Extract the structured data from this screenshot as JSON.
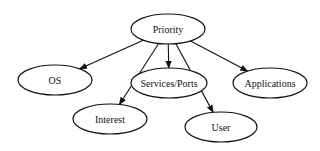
{
  "diagram": {
    "type": "tree",
    "root": "Priority",
    "nodes": [
      {
        "id": "priority",
        "label": "Priority",
        "cx": 168,
        "cy": 29,
        "rx": 37,
        "ry": 15
      },
      {
        "id": "os",
        "label": "OS",
        "cx": 55,
        "cy": 80,
        "rx": 37,
        "ry": 15
      },
      {
        "id": "services",
        "label": "Services/Ports",
        "cx": 169,
        "cy": 83,
        "rx": 38,
        "ry": 15
      },
      {
        "id": "applications",
        "label": "Applications",
        "cx": 270,
        "cy": 83,
        "rx": 37,
        "ry": 15
      },
      {
        "id": "interest",
        "label": "Interest",
        "cx": 110,
        "cy": 119,
        "rx": 37,
        "ry": 15
      },
      {
        "id": "user",
        "label": "User",
        "cx": 221,
        "cy": 127,
        "rx": 36,
        "ry": 15
      }
    ],
    "edges": [
      {
        "from": "Priority",
        "to": "OS"
      },
      {
        "from": "Priority",
        "to": "Interest"
      },
      {
        "from": "Priority",
        "to": "Services/Ports"
      },
      {
        "from": "Priority",
        "to": "User"
      },
      {
        "from": "Priority",
        "to": "Applications"
      }
    ],
    "colors": {
      "stroke": "#111111",
      "fill": "#ffffff",
      "background": "#ffffff"
    }
  }
}
